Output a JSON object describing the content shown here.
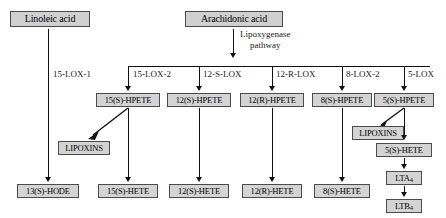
{
  "diagram": {
    "substrates": {
      "linoleic": "Linoleic acid",
      "arachidonic": "Arachidonic acid"
    },
    "pathway_label_line1": "Lipoxygenase",
    "pathway_label_line2": "pathway",
    "enzymes": [
      {
        "name": "15-LOX-1"
      },
      {
        "name": "15-LOX-2"
      },
      {
        "name": "12-S-LOX"
      },
      {
        "name": "12-R-LOX"
      },
      {
        "name": "8-LOX-2"
      },
      {
        "name": "5-LOX"
      }
    ],
    "hpete_products": [
      {
        "name": "15(S)-HPETE"
      },
      {
        "name": "12(S)-HPETE"
      },
      {
        "name": "12(R)-HPETE"
      },
      {
        "name": "8(S)-HPETE"
      },
      {
        "name": "5(S)-HPETE"
      }
    ],
    "terminal_products": [
      {
        "name": "13(S)-HODE"
      },
      {
        "name": "15(S)-HETE"
      },
      {
        "name": "12(S)-HETE"
      },
      {
        "name": "12(R)-HETE"
      },
      {
        "name": "8(S)-HETE"
      }
    ],
    "lipoxins_left": "LIPOXINS",
    "lipoxins_right": "LIPOXINS",
    "five_lox_chain": [
      {
        "name": "5(S)-HETE"
      },
      {
        "name": "LTA",
        "subscript": "4"
      },
      {
        "name": "LTB",
        "subscript": "4"
      }
    ],
    "colors": {
      "box_fill": "#d4d4d4",
      "box_border": "#4a4a4a",
      "line": "#111111",
      "text": "#000000",
      "background": "#ffffff"
    }
  }
}
